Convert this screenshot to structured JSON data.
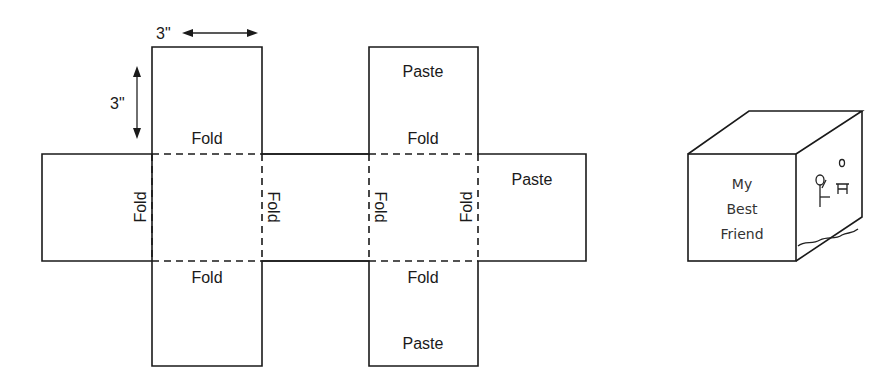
{
  "net": {
    "dimension_width": "3\"",
    "dimension_height": "3\"",
    "labels": {
      "top_left_fold": "Fold",
      "top_right_paste": "Paste",
      "top_right_fold": "Fold",
      "side_fold_1": "Fold",
      "side_fold_2": "Fold",
      "side_fold_3": "Fold",
      "side_fold_4": "Fold",
      "right_paste": "Paste",
      "bottom_left_fold": "Fold",
      "bottom_right_fold": "Fold",
      "bottom_right_paste": "Paste"
    }
  },
  "cube": {
    "front_text_line1": "My",
    "front_text_line2": "Best",
    "front_text_line3": "Friend"
  }
}
